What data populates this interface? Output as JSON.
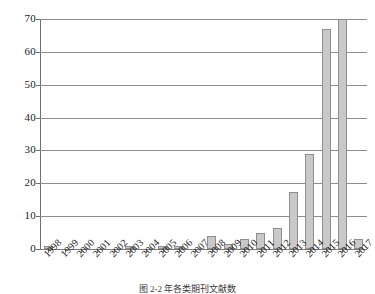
{
  "chart_data": {
    "type": "bar",
    "title": "",
    "subtitle": "",
    "xlabel": "",
    "ylabel": "",
    "categories": [
      "1998",
      "1999",
      "2000",
      "2001",
      "2002",
      "2003",
      "2004",
      "2005",
      "2006",
      "2007",
      "2008",
      "2009",
      "2010",
      "2011",
      "2012",
      "2013",
      "2014",
      "2015",
      "2016",
      "2017"
    ],
    "values": [
      1,
      0,
      0,
      0,
      0,
      1,
      0,
      1,
      1,
      0,
      4,
      1.5,
      3,
      5,
      6.5,
      17.5,
      29,
      67,
      70,
      3
    ],
    "series": [
      {
        "name": "count",
        "values": [
          1,
          0,
          0,
          0,
          0,
          1,
          0,
          1,
          1,
          0,
          4,
          1.5,
          3,
          5,
          6.5,
          17.5,
          29,
          67,
          70,
          3
        ]
      }
    ],
    "ylim": [
      0,
      70
    ],
    "yticks": [
      0,
      10,
      20,
      30,
      40,
      50,
      60,
      70
    ],
    "ytick_labels": [
      "0",
      "10",
      "20",
      "30",
      "40",
      "50",
      "60",
      "70"
    ],
    "grid": "horizontal",
    "legend": "none",
    "bar_color": "#c9c9c9",
    "bar_border_color": "#8f8f8f",
    "gridline_color": "#8c8c8c",
    "axis_color": "#6e6e6e"
  },
  "caption": {
    "text": "图 2-2   年各类期刊文献数"
  }
}
